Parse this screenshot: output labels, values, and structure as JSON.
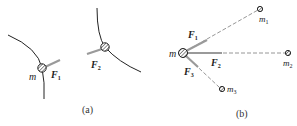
{
  "panels": [
    {
      "caption": "(a)",
      "particles": [
        {
          "label": "m",
          "force_label": "F",
          "force_sub": "1"
        },
        {
          "label": "",
          "force_label": "F",
          "force_sub": "2"
        }
      ]
    },
    {
      "caption": "(b)",
      "center_label": "m",
      "bodies": [
        {
          "label": "m",
          "sub": "1"
        },
        {
          "label": "m",
          "sub": "2"
        },
        {
          "label": "m",
          "sub": "3"
        }
      ],
      "forces": [
        {
          "label": "F",
          "sub": "1"
        },
        {
          "label": "F",
          "sub": "2"
        },
        {
          "label": "F",
          "sub": "3"
        }
      ]
    }
  ],
  "colors": {
    "line": "#222222",
    "force_arrow": "#9a9a9a",
    "dashed": "#8a8a8a"
  }
}
